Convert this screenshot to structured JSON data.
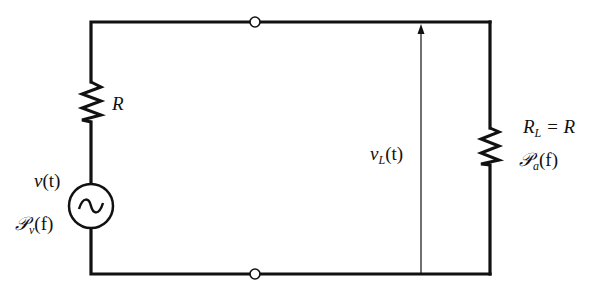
{
  "diagram": {
    "type": "circuit",
    "colors": {
      "wire": "#111111",
      "background": "#ffffff"
    },
    "components": {
      "source_resistor": {
        "label": "R"
      },
      "source": {
        "symbol": "ac-voltage-source",
        "glyph": "~",
        "voltage_label": {
          "var": "v",
          "arg": "(t)"
        },
        "psd_label": {
          "var": "𝒫",
          "sub": "v",
          "arg": "(f)"
        }
      },
      "load_resistor": {
        "label": {
          "var": "R",
          "sub": "L",
          "rest": " = R"
        },
        "psd_label": {
          "var": "𝒫",
          "sub": "a",
          "arg": "(f)"
        }
      },
      "load_voltage": {
        "var": "v",
        "sub": "L",
        "arg": "(t)"
      },
      "terminals": [
        "top-terminal",
        "bottom-terminal"
      ]
    }
  }
}
